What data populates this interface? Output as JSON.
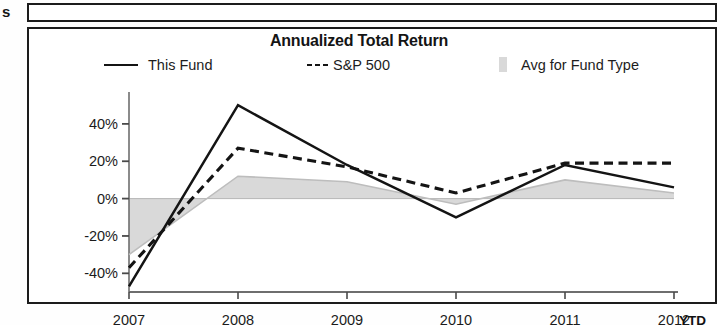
{
  "page": {
    "stray_letter": "s"
  },
  "chart_panel": {
    "title": "Annualized Total Return",
    "ytd_note": "YTD"
  },
  "legend": {
    "position": "top",
    "items": [
      {
        "label": "This Fund",
        "marker": "solid-line",
        "color": "#141414"
      },
      {
        "label": "S&P 500",
        "marker": "dashed-line",
        "color": "#141414",
        "prefix": "---"
      },
      {
        "label": "Avg for Fund Type",
        "marker": "gray-swatch",
        "color": "#d9d9d9"
      }
    ]
  },
  "chart_data": {
    "type": "line",
    "title": "Annualized Total Return",
    "xlabel": "",
    "ylabel": "",
    "x": [
      "2007",
      "2008",
      "2009",
      "2010",
      "2011",
      "2012 YTD"
    ],
    "xtick_labels": [
      "2007",
      "2008",
      "2009",
      "2010",
      "2011",
      "2012"
    ],
    "ytick_labels": [
      "40%",
      "20%",
      "0%",
      "-20%",
      "-40%"
    ],
    "ytick_values": [
      40,
      20,
      0,
      -20,
      -40
    ],
    "ylim": [
      -50,
      56
    ],
    "grid": false,
    "zero_line": true,
    "legend_position": "top",
    "series": [
      {
        "name": "This Fund",
        "style": "solid",
        "color": "#141414",
        "values": [
          -47,
          50,
          18,
          -10,
          18,
          6
        ]
      },
      {
        "name": "S&P 500",
        "style": "dashed",
        "color": "#141414",
        "values": [
          -37,
          27,
          17,
          3,
          19,
          19
        ]
      },
      {
        "name": "Avg for Fund Type",
        "style": "area",
        "color": "#d9d9d9",
        "values": [
          -30,
          12,
          9,
          -3,
          10,
          3
        ]
      }
    ]
  },
  "axis": {
    "y_ticks": [
      {
        "label": "40%",
        "value": 40
      },
      {
        "label": "20%",
        "value": 20
      },
      {
        "label": "0%",
        "value": 0
      },
      {
        "label": "-20%",
        "value": -20
      },
      {
        "label": "-40%",
        "value": -40
      }
    ],
    "x_ticks": [
      {
        "label": "2007"
      },
      {
        "label": "2008"
      },
      {
        "label": "2009"
      },
      {
        "label": "2010"
      },
      {
        "label": "2011"
      },
      {
        "label": "2012"
      }
    ]
  }
}
